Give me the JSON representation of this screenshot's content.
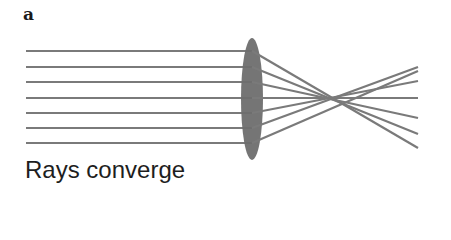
{
  "panel_label": "a",
  "caption": "Rays converge",
  "colors": {
    "ray": "#7a7a7a",
    "lens": "#6e6e6e",
    "text": "#1a1a1a"
  },
  "diagram": {
    "type": "converging-lens",
    "ray_count": 7,
    "ray_start_x": 26,
    "lens_center_x": 252,
    "focal_point": [
      350,
      98
    ],
    "ray_end_x": 418
  }
}
